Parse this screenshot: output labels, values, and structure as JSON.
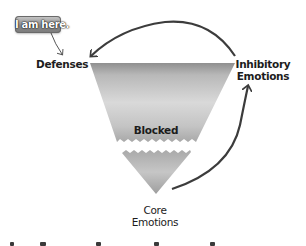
{
  "diagram": {
    "type": "inverted-triangle model",
    "badge": {
      "text": "I am here.",
      "color": "#8e8e8e"
    },
    "labels": {
      "defenses": "Defenses",
      "inhibitory_line1": "Inhibitory",
      "inhibitory_line2": "Emotions",
      "blocked": "Blocked",
      "core_line1": "Core",
      "core_line2": "Emotions"
    },
    "arrows": [
      {
        "from": "badge",
        "to": "Defenses"
      },
      {
        "from": "Inhibitory Emotions",
        "to": "Defenses"
      },
      {
        "from": "Core Emotions",
        "to": "Inhibitory Emotions"
      }
    ],
    "colors": {
      "triangle_top": "#9a9a9a",
      "triangle_mid": "#d8d8d8",
      "arrow": "#3c3c3c",
      "text": "#1c1c1c"
    }
  }
}
